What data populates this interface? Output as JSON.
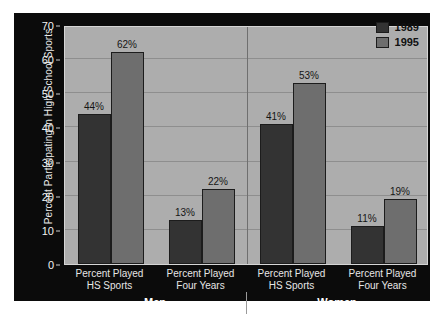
{
  "chart_data": {
    "type": "bar",
    "title": "",
    "xlabel": "",
    "ylabel": "Percent Participating in High School Sports",
    "ylim": [
      0,
      70
    ],
    "ytick_values": [
      0,
      10,
      20,
      30,
      40,
      50,
      60,
      70
    ],
    "ytick_labels": [
      "0",
      "10",
      "20",
      "30",
      "40",
      "50",
      "60",
      "70"
    ],
    "grid": true,
    "legend_position": "top-right",
    "value_suffix": "%",
    "groups": [
      "Men",
      "Women"
    ],
    "categories": [
      "Percent Played HS Sports",
      "Percent Played Four Years",
      "Percent Played HS Sports",
      "Percent Played Four Years"
    ],
    "category_lines": [
      [
        "Percent Played",
        "HS Sports"
      ],
      [
        "Percent Played",
        "Four Years"
      ],
      [
        "Percent Played",
        "HS Sports"
      ],
      [
        "Percent Played",
        "Four Years"
      ]
    ],
    "series": [
      {
        "name": "1989",
        "color": "#333333",
        "values": [
          44,
          13,
          41,
          11
        ]
      },
      {
        "name": "1995",
        "color": "#6e6e6e",
        "values": [
          62,
          22,
          53,
          19
        ]
      }
    ],
    "data_labels": [
      "44%",
      "62%",
      "13%",
      "22%",
      "41%",
      "53%",
      "11%",
      "19%"
    ],
    "colors": {
      "panel_background": "#0b0b0b",
      "plot_background": "#adadad",
      "gridline": "#8e8e8e",
      "series_1989": "#333333",
      "series_1995": "#6e6e6e",
      "axis_text": "#f2f2f2",
      "label_text": "#151515"
    }
  },
  "legend": {
    "items": [
      {
        "label": "1989"
      },
      {
        "label": "1995"
      }
    ]
  },
  "axis": {
    "y_title": "Percent Participating in High School Sports",
    "ticks": [
      "70",
      "60",
      "50",
      "40",
      "30",
      "20",
      "10",
      "0"
    ]
  },
  "groups": [
    {
      "label": "Men"
    },
    {
      "label": "Women"
    }
  ],
  "categories": [
    {
      "line1": "Percent Played",
      "line2": "HS Sports"
    },
    {
      "line1": "Percent Played",
      "line2": "Four Years"
    },
    {
      "line1": "Percent Played",
      "line2": "HS Sports"
    },
    {
      "line1": "Percent Played",
      "line2": "Four Years"
    }
  ],
  "bars": [
    {
      "value_label": "44%"
    },
    {
      "value_label": "62%"
    },
    {
      "value_label": "13%"
    },
    {
      "value_label": "22%"
    },
    {
      "value_label": "41%"
    },
    {
      "value_label": "53%"
    },
    {
      "value_label": "11%"
    },
    {
      "value_label": "19%"
    }
  ]
}
